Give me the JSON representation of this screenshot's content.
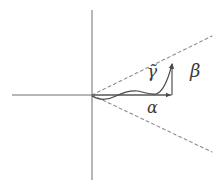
{
  "figure": {
    "name": "cone-curve-decomposition-diagram",
    "caption": "",
    "background_color": "#ffffff",
    "axis_color": "#6e6e73",
    "curve_color": "#4a4a4a",
    "dashed_color": "#8a8a8f",
    "label_color": "#3a3a3a",
    "width": 220,
    "height": 187
  },
  "axes": {
    "origin": {
      "x": 92,
      "y": 95
    },
    "horizontal": {
      "x1": 12,
      "y1": 95,
      "x2": 172,
      "y2": 95,
      "label": "horizontal-axis"
    },
    "vertical": {
      "x1": 92,
      "y1": 10,
      "x2": 92,
      "y2": 180,
      "label": "vertical-axis"
    }
  },
  "cone": {
    "upper_ray": {
      "x1": 92,
      "y1": 95,
      "x2": 212,
      "y2": 36
    },
    "lower_ray": {
      "x1": 92,
      "y1": 95,
      "x2": 212,
      "y2": 152
    },
    "dash_pattern": "3 3"
  },
  "curve": {
    "name": "gamma-tilde-curve",
    "path": "M 92 96 C 100 101, 108 100, 116 96 C 123 92.5, 130 90, 138 91 C 146 92.5, 150 95, 156 94 C 163 92, 168 80, 172 64",
    "arrow_tip": {
      "x": 172,
      "y": 62
    }
  },
  "vectors": [
    {
      "name": "alpha-vector",
      "label": "α",
      "from": {
        "x": 92,
        "y": 95
      },
      "to": {
        "x": 172,
        "y": 95
      },
      "orientation": "horizontal"
    },
    {
      "name": "beta-vector",
      "label": "β",
      "from": {
        "x": 172,
        "y": 95
      },
      "to": {
        "x": 172,
        "y": 62
      },
      "orientation": "vertical"
    }
  ],
  "labels": {
    "gamma": "γ̃",
    "beta": "β",
    "alpha": "α"
  }
}
